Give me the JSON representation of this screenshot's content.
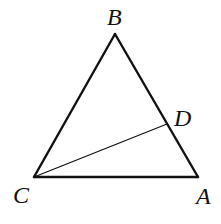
{
  "diagram": {
    "background": "#ffffff",
    "stroke_color": "#111111",
    "points": {
      "A": {
        "label": "A",
        "x": 198,
        "y": 177,
        "label_x": 196,
        "label_y": 204
      },
      "B": {
        "label": "B",
        "x": 115,
        "y": 34,
        "label_x": 107,
        "label_y": 25
      },
      "C": {
        "label": "C",
        "x": 34,
        "y": 177,
        "label_x": 13,
        "label_y": 203
      },
      "D": {
        "label": "D",
        "x": 167,
        "y": 124,
        "label_x": 174,
        "label_y": 126
      }
    },
    "edges": [
      {
        "from": "B",
        "to": "C"
      },
      {
        "from": "B",
        "to": "A"
      },
      {
        "from": "C",
        "to": "A"
      }
    ],
    "segments": [
      {
        "from": "C",
        "to": "D"
      }
    ]
  }
}
